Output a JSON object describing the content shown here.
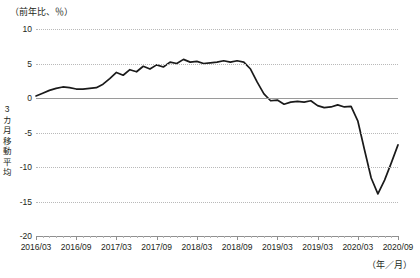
{
  "chart_data": {
    "type": "line",
    "title": "",
    "unit_caption": "（前年比、％）",
    "ylabel": "3カ月移動平均",
    "ylabel_chars": [
      "3",
      "カ",
      "月",
      "移",
      "動",
      "平",
      "均"
    ],
    "xlabel": "（年／月）",
    "ylim": [
      -20,
      10
    ],
    "ytick_values": [
      10,
      5,
      0,
      -5,
      -10,
      -15,
      -20
    ],
    "ytick_labels": [
      "10",
      "5",
      "0",
      "-5",
      "-10",
      "-15",
      "-20"
    ],
    "grid": true,
    "legend": "none",
    "xtick_labels": [
      "2016/03",
      "2016/09",
      "2017/03",
      "2017/09",
      "2018/03",
      "2018/09",
      "2019/03",
      "2019/03",
      "2020/03",
      "2020/09"
    ],
    "xtick_index": [
      0,
      6,
      12,
      18,
      24,
      30,
      36,
      42,
      48,
      54
    ],
    "x": [
      "2016/03",
      "2016/04",
      "2016/05",
      "2016/06",
      "2016/07",
      "2016/08",
      "2016/09",
      "2016/10",
      "2016/11",
      "2016/12",
      "2017/01",
      "2017/02",
      "2017/03",
      "2017/04",
      "2017/05",
      "2017/06",
      "2017/07",
      "2017/08",
      "2017/09",
      "2017/10",
      "2017/11",
      "2017/12",
      "2018/01",
      "2018/02",
      "2018/03",
      "2018/04",
      "2018/05",
      "2018/06",
      "2018/07",
      "2018/08",
      "2018/09",
      "2018/10",
      "2018/11",
      "2018/12",
      "2019/01",
      "2019/02",
      "2019/03",
      "2019/04",
      "2019/05",
      "2019/06",
      "2019/07",
      "2019/08",
      "2019/09",
      "2019/10",
      "2019/11",
      "2019/12",
      "2020/01",
      "2020/02",
      "2020/03",
      "2020/04",
      "2020/05",
      "2020/06",
      "2020/07",
      "2020/08",
      "2020/09"
    ],
    "series": [
      {
        "name": "3カ月移動平均",
        "values": [
          0.3,
          0.7,
          1.1,
          1.4,
          1.6,
          1.5,
          1.3,
          1.3,
          1.4,
          1.5,
          2.0,
          2.8,
          3.7,
          3.3,
          4.1,
          3.8,
          4.6,
          4.2,
          4.8,
          4.5,
          5.2,
          5.0,
          5.6,
          5.2,
          5.3,
          5.0,
          5.1,
          5.2,
          5.4,
          5.2,
          5.4,
          5.2,
          4.2,
          2.3,
          0.6,
          -0.4,
          -0.3,
          -0.9,
          -0.6,
          -0.5,
          -0.6,
          -0.4,
          -1.1,
          -1.4,
          -1.3,
          -1.0,
          -1.3,
          -1.2,
          -3.3,
          -7.5,
          -11.6,
          -13.9,
          -11.9,
          -9.4,
          -6.8
        ]
      }
    ]
  }
}
